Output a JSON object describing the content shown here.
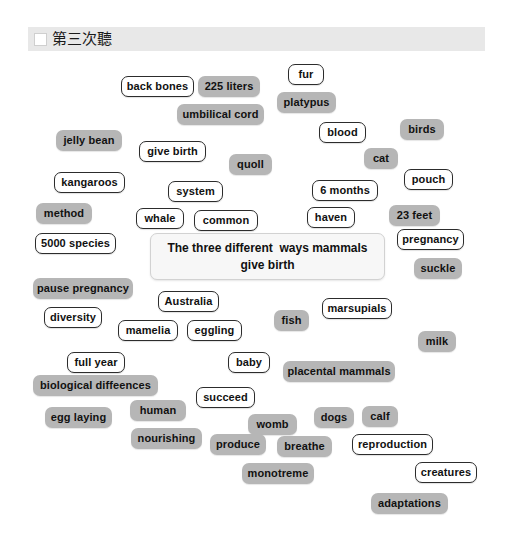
{
  "header": {
    "checkbox_checked": false,
    "title": "第三次聽",
    "bar_color": "#e8e8e8"
  },
  "center_box": {
    "text": "The three different  ways mammals give birth",
    "background": "#f7f7f7",
    "border_color": "#d2d2d2"
  },
  "styles": {
    "gray_fill": "#b6b6b6",
    "white_fill": "#ffffff",
    "white_border": "#2c2c2c",
    "text_color": "#111111"
  },
  "tiles": [
    {
      "label": "back bones",
      "style": "white",
      "x": 121,
      "y": 76,
      "w": 73
    },
    {
      "label": "225 liters",
      "style": "gray",
      "x": 198,
      "y": 76,
      "w": 62
    },
    {
      "label": "fur",
      "style": "white",
      "x": 288,
      "y": 64,
      "w": 36
    },
    {
      "label": "platypus",
      "style": "gray",
      "x": 277,
      "y": 92,
      "w": 59
    },
    {
      "label": "umbilical cord",
      "style": "gray",
      "x": 177,
      "y": 104,
      "w": 87
    },
    {
      "label": "blood",
      "style": "white",
      "x": 319,
      "y": 122,
      "w": 47
    },
    {
      "label": "birds",
      "style": "gray",
      "x": 400,
      "y": 119,
      "w": 44
    },
    {
      "label": "jelly bean",
      "style": "gray",
      "x": 56,
      "y": 130,
      "w": 66
    },
    {
      "label": "give birth",
      "style": "white",
      "x": 139,
      "y": 141,
      "w": 67
    },
    {
      "label": "quoll",
      "style": "gray",
      "x": 229,
      "y": 154,
      "w": 43
    },
    {
      "label": "cat",
      "style": "gray",
      "x": 364,
      "y": 148,
      "w": 34
    },
    {
      "label": "pouch",
      "style": "white",
      "x": 404,
      "y": 169,
      "w": 49
    },
    {
      "label": "kangaroos",
      "style": "white",
      "x": 54,
      "y": 172,
      "w": 71
    },
    {
      "label": "system",
      "style": "white",
      "x": 168,
      "y": 181,
      "w": 55
    },
    {
      "label": "6 months",
      "style": "white",
      "x": 312,
      "y": 180,
      "w": 66
    },
    {
      "label": "method",
      "style": "gray",
      "x": 36,
      "y": 203,
      "w": 56
    },
    {
      "label": "whale",
      "style": "white",
      "x": 136,
      "y": 208,
      "w": 48
    },
    {
      "label": "common",
      "style": "white",
      "x": 194,
      "y": 210,
      "w": 64
    },
    {
      "label": "haven",
      "style": "white",
      "x": 307,
      "y": 207,
      "w": 48
    },
    {
      "label": "23 feet",
      "style": "gray",
      "x": 389,
      "y": 205,
      "w": 51
    },
    {
      "label": "5000 species",
      "style": "white",
      "x": 35,
      "y": 233,
      "w": 81
    },
    {
      "label": "pregnancy",
      "style": "white",
      "x": 397,
      "y": 229,
      "w": 67
    },
    {
      "label": "suckle",
      "style": "gray",
      "x": 414,
      "y": 258,
      "w": 48
    },
    {
      "label": "pause pregnancy",
      "style": "gray",
      "x": 33,
      "y": 278,
      "w": 100
    },
    {
      "label": "Australia",
      "style": "white",
      "x": 158,
      "y": 291,
      "w": 61
    },
    {
      "label": "marsupials",
      "style": "white",
      "x": 322,
      "y": 298,
      "w": 70
    },
    {
      "label": "diversity",
      "style": "white",
      "x": 44,
      "y": 307,
      "w": 58
    },
    {
      "label": "mamelia",
      "style": "white",
      "x": 118,
      "y": 320,
      "w": 60
    },
    {
      "label": "eggling",
      "style": "white",
      "x": 187,
      "y": 320,
      "w": 55
    },
    {
      "label": "fish",
      "style": "gray",
      "x": 274,
      "y": 310,
      "w": 35
    },
    {
      "label": "milk",
      "style": "gray",
      "x": 418,
      "y": 331,
      "w": 38
    },
    {
      "label": "full year",
      "style": "white",
      "x": 67,
      "y": 352,
      "w": 58
    },
    {
      "label": "baby",
      "style": "white",
      "x": 228,
      "y": 352,
      "w": 42
    },
    {
      "label": "placental mammals",
      "style": "gray",
      "x": 283,
      "y": 361,
      "w": 112
    },
    {
      "label": "biological diffeences",
      "style": "gray",
      "x": 33,
      "y": 375,
      "w": 125
    },
    {
      "label": "succeed",
      "style": "white",
      "x": 196,
      "y": 387,
      "w": 59
    },
    {
      "label": "egg laying",
      "style": "gray",
      "x": 45,
      "y": 407,
      "w": 67
    },
    {
      "label": "human",
      "style": "gray",
      "x": 130,
      "y": 400,
      "w": 56
    },
    {
      "label": "womb",
      "style": "gray",
      "x": 248,
      "y": 414,
      "w": 49
    },
    {
      "label": "dogs",
      "style": "gray",
      "x": 314,
      "y": 407,
      "w": 40
    },
    {
      "label": "calf",
      "style": "gray",
      "x": 362,
      "y": 406,
      "w": 36
    },
    {
      "label": "nourishing",
      "style": "gray",
      "x": 131,
      "y": 428,
      "w": 71
    },
    {
      "label": "produce",
      "style": "gray",
      "x": 210,
      "y": 434,
      "w": 56
    },
    {
      "label": "breathe",
      "style": "gray",
      "x": 277,
      "y": 436,
      "w": 55
    },
    {
      "label": "reproduction",
      "style": "white",
      "x": 352,
      "y": 434,
      "w": 81
    },
    {
      "label": "monotreme",
      "style": "gray",
      "x": 242,
      "y": 463,
      "w": 72
    },
    {
      "label": "creatures",
      "style": "white",
      "x": 415,
      "y": 462,
      "w": 62
    },
    {
      "label": "adaptations",
      "style": "gray",
      "x": 371,
      "y": 493,
      "w": 77
    }
  ]
}
